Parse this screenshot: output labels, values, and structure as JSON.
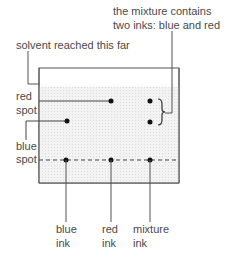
{
  "annotations": {
    "mixture_note_line1": "the mixture contains",
    "mixture_note_line2": "two inks: blue and red",
    "solvent_note": "solvent reached this far",
    "red_spot_line1": "red",
    "red_spot_line2": "spot",
    "blue_spot_line1": "blue",
    "blue_spot_line2": "spot"
  },
  "samples": [
    {
      "line1": "blue",
      "line2": "ink"
    },
    {
      "line1": "red",
      "line2": "ink"
    },
    {
      "line1": "mixture",
      "line2": "ink"
    }
  ],
  "colors": {
    "line": "#444444",
    "shade": "#ececec",
    "dot": "#111111"
  }
}
